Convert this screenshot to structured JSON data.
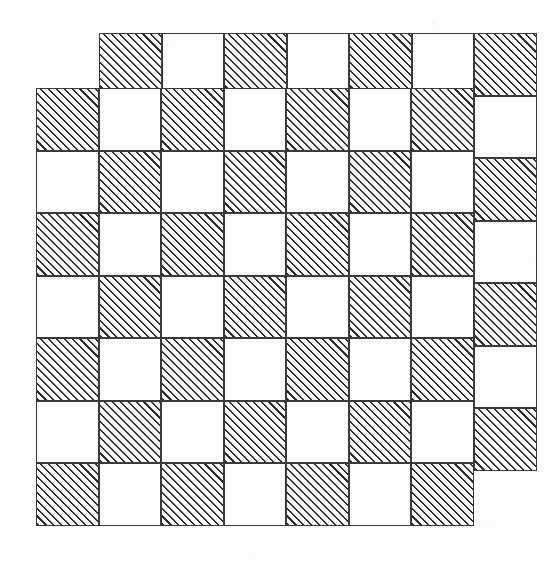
{
  "figure": {
    "canvas": {
      "width": 556,
      "height": 571
    },
    "background_color": "#fdfdfd",
    "line_color": "#3a3a3a",
    "hatch_color": "#2e2e2e",
    "hatch_angle_degrees": 45,
    "hatch_spacing_px": 5.6,
    "cell_size_px": 62.5,
    "border_width_px": 1.6
  },
  "grids": [
    {
      "name": "upper-right-grid",
      "origin_x": 99,
      "origin_y": 33,
      "rows": 7,
      "cols": 7,
      "cell": 62.5,
      "first_cell_hatched": true,
      "pattern": [
        [
          1,
          0,
          1,
          0,
          1,
          0,
          1
        ],
        [
          0,
          1,
          0,
          1,
          0,
          1,
          0
        ],
        [
          1,
          0,
          1,
          0,
          1,
          0,
          1
        ],
        [
          0,
          1,
          0,
          1,
          0,
          1,
          0
        ],
        [
          1,
          0,
          1,
          0,
          1,
          0,
          1
        ],
        [
          0,
          1,
          0,
          1,
          0,
          1,
          0
        ],
        [
          1,
          0,
          1,
          0,
          1,
          0,
          1
        ]
      ]
    },
    {
      "name": "lower-left-grid",
      "origin_x": 36,
      "origin_y": 88,
      "rows": 7,
      "cols": 7,
      "cell": 62.5,
      "first_cell_hatched": true,
      "pattern": [
        [
          1,
          0,
          1,
          0,
          1,
          0,
          1
        ],
        [
          0,
          1,
          0,
          1,
          0,
          1,
          0
        ],
        [
          1,
          0,
          1,
          0,
          1,
          0,
          1
        ],
        [
          0,
          1,
          0,
          1,
          0,
          1,
          0
        ],
        [
          1,
          0,
          1,
          0,
          1,
          0,
          1
        ],
        [
          0,
          1,
          0,
          1,
          0,
          1,
          0
        ],
        [
          1,
          0,
          1,
          0,
          1,
          0,
          1
        ]
      ]
    }
  ],
  "legend": {
    "hatched_label": "hatched square",
    "plain_label": "blank square"
  }
}
